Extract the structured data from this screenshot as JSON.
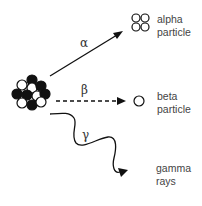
{
  "diagram": {
    "nucleus": {
      "label": "radioactive nucleus"
    },
    "emissions": [
      {
        "symbol": "α",
        "line1": "alpha",
        "line2": "particle",
        "arrow_style": "solid"
      },
      {
        "symbol": "β",
        "line1": "beta",
        "line2": "particle",
        "arrow_style": "dashed"
      },
      {
        "symbol": "γ",
        "line1": "gamma",
        "line2": "rays",
        "arrow_style": "wavy"
      }
    ]
  }
}
